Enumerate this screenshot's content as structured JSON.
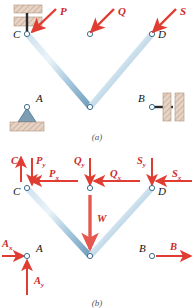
{
  "figure": {
    "captions": {
      "a": "(a)",
      "b": "(b)"
    },
    "colors": {
      "member_light": "#d9e7f2",
      "member_mid": "#9dc0d8",
      "member_dark": "#6f9dbd",
      "member_edge": "#4a7f9e",
      "force_red": "#e03c31",
      "label_red": "#cc2a2a",
      "hatch_block": "#e4cdbe",
      "hatch_line": "#b08f7a",
      "joint_fill": "#ffffff",
      "joint_stroke": "#3d6e8c",
      "support_dark": "#2b2b2b",
      "caption_gray": "#555555"
    }
  },
  "panel_a": {
    "name": "truss-with-supports",
    "joints": [
      {
        "id": "C",
        "label": "C",
        "x": 27,
        "y": 34
      },
      {
        "id": "T",
        "label": "",
        "x": 90,
        "y": 34
      },
      {
        "id": "D",
        "label": "D",
        "x": 152,
        "y": 34
      },
      {
        "id": "A",
        "label": "A",
        "x": 27,
        "y": 107
      },
      {
        "id": "E",
        "label": "",
        "x": 90,
        "y": 107
      },
      {
        "id": "B",
        "label": "B",
        "x": 152,
        "y": 107
      }
    ],
    "joint_labels": [
      {
        "text": "C",
        "x": 16,
        "y": 34
      },
      {
        "text": "D",
        "x": 160,
        "y": 34
      },
      {
        "text": "A",
        "x": 38,
        "y": 99
      },
      {
        "text": "B",
        "x": 140,
        "y": 99
      }
    ],
    "members": [
      {
        "from": "C",
        "to": "T"
      },
      {
        "from": "T",
        "to": "D"
      },
      {
        "from": "A",
        "to": "E"
      },
      {
        "from": "E",
        "to": "B"
      },
      {
        "from": "C",
        "to": "A"
      },
      {
        "from": "T",
        "to": "E"
      },
      {
        "from": "D",
        "to": "B"
      },
      {
        "from": "C",
        "to": "E"
      },
      {
        "from": "E",
        "to": "D"
      }
    ],
    "loads": [
      {
        "name": "P",
        "label": "P",
        "tip_x": 30,
        "tip_y": 33,
        "tail_x": 56,
        "tail_y": 9,
        "label_x": 60,
        "label_y": 13
      },
      {
        "name": "Q",
        "label": "Q",
        "tip_x": 90,
        "tip_y": 33,
        "tail_x": 114,
        "tail_y": 9,
        "label_x": 118,
        "label_y": 13
      },
      {
        "name": "S",
        "label": "S",
        "tip_x": 152,
        "tip_y": 33,
        "tail_x": 176,
        "tail_y": 9,
        "label_x": 180,
        "label_y": 13
      }
    ],
    "supports": [
      {
        "name": "link-support-C",
        "type": "link-vertical",
        "x": 27,
        "y": 34
      },
      {
        "name": "pin-support-A",
        "type": "pin",
        "x": 27,
        "y": 107
      },
      {
        "name": "link-support-B",
        "type": "link-horizontal",
        "x": 152,
        "y": 107
      }
    ]
  },
  "panel_b": {
    "name": "free-body-diagram",
    "joints": [
      {
        "id": "C",
        "label": "C",
        "x": 27,
        "y": 38
      },
      {
        "id": "T",
        "label": "",
        "x": 90,
        "y": 38
      },
      {
        "id": "D",
        "label": "D",
        "x": 152,
        "y": 38
      },
      {
        "id": "A",
        "label": "A",
        "x": 27,
        "y": 106
      },
      {
        "id": "E",
        "label": "",
        "x": 90,
        "y": 106
      },
      {
        "id": "B",
        "label": "B",
        "x": 152,
        "y": 106
      }
    ],
    "joint_labels": [
      {
        "text": "C",
        "x": 16,
        "y": 41
      },
      {
        "text": "D",
        "x": 160,
        "y": 41
      },
      {
        "text": "A",
        "x": 38,
        "y": 99
      },
      {
        "text": "B",
        "x": 141,
        "y": 99
      }
    ],
    "members": [
      {
        "from": "C",
        "to": "T"
      },
      {
        "from": "T",
        "to": "D"
      },
      {
        "from": "A",
        "to": "E"
      },
      {
        "from": "E",
        "to": "B"
      },
      {
        "from": "C",
        "to": "A"
      },
      {
        "from": "T",
        "to": "E"
      },
      {
        "from": "D",
        "to": "B"
      },
      {
        "from": "C",
        "to": "E"
      },
      {
        "from": "E",
        "to": "D"
      }
    ],
    "force_labels": [
      {
        "name": "reaction-C",
        "base": "C",
        "sub": "",
        "x": 14,
        "y": 10
      },
      {
        "name": "load-Py",
        "base": "P",
        "sub": "y",
        "x": 34,
        "y": 10
      },
      {
        "name": "load-Px",
        "base": "P",
        "sub": "x",
        "x": 49,
        "y": 24
      },
      {
        "name": "load-Qy",
        "base": "Q",
        "sub": "y",
        "x": 75,
        "y": 10
      },
      {
        "name": "load-Qx",
        "base": "Q",
        "sub": "x",
        "x": 110,
        "y": 24
      },
      {
        "name": "load-Sy",
        "base": "S",
        "sub": "y",
        "x": 138,
        "y": 10
      },
      {
        "name": "load-Sx",
        "base": "S",
        "sub": "x",
        "x": 173,
        "y": 24
      },
      {
        "name": "weight-W",
        "base": "W",
        "sub": "",
        "x": 98,
        "y": 68
      },
      {
        "name": "reaction-Ax",
        "base": "A",
        "sub": "x",
        "x": 4,
        "y": 94
      },
      {
        "name": "reaction-Ay",
        "base": "A",
        "sub": "y",
        "x": 36,
        "y": 131
      },
      {
        "name": "reaction-B",
        "base": "B",
        "sub": "",
        "x": 158,
        "y": 97
      }
    ],
    "force_arrows": [
      {
        "name": "arrow-C",
        "x1": 21,
        "y1": 32,
        "x2": 21,
        "y2": 8,
        "dir": "up"
      },
      {
        "name": "arrow-Py",
        "x1": 32,
        "y1": 8,
        "x2": 32,
        "y2": 36,
        "dir": "down"
      },
      {
        "name": "arrow-Px",
        "x1": 78,
        "y1": 31,
        "x2": 31,
        "y2": 31,
        "dir": "left"
      },
      {
        "name": "arrow-Qy",
        "x1": 90,
        "y1": 8,
        "x2": 90,
        "y2": 36,
        "dir": "down"
      },
      {
        "name": "arrow-Qx",
        "x1": 140,
        "y1": 31,
        "x2": 94,
        "y2": 31,
        "dir": "left"
      },
      {
        "name": "arrow-Sy",
        "x1": 152,
        "y1": 8,
        "x2": 152,
        "y2": 36,
        "dir": "down"
      },
      {
        "name": "arrow-Sx",
        "x1": 192,
        "y1": 31,
        "x2": 156,
        "y2": 31,
        "dir": "left"
      },
      {
        "name": "arrow-W",
        "x1": 90,
        "y1": 44,
        "x2": 90,
        "y2": 100,
        "dir": "down"
      },
      {
        "name": "arrow-Ax",
        "x1": 2,
        "y1": 106,
        "x2": 25,
        "y2": 106,
        "dir": "right"
      },
      {
        "name": "arrow-Ay",
        "x1": 27,
        "y1": 146,
        "x2": 27,
        "y2": 110,
        "dir": "up"
      },
      {
        "name": "arrow-B",
        "x1": 156,
        "y1": 106,
        "x2": 192,
        "y2": 106,
        "dir": "right"
      }
    ]
  }
}
